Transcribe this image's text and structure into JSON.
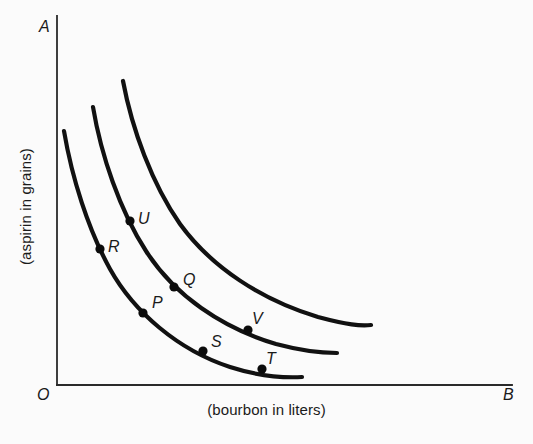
{
  "figure": {
    "background_color": "#fbfbfb",
    "ink_color": "#111111",
    "width": 533,
    "height": 444
  },
  "axes": {
    "y_axis_letter": "A",
    "x_axis_letter": "B",
    "origin_letter": "O",
    "x_title": "(bourbon in liters)",
    "y_title": "(aspirin in grains)",
    "x_axis_pixels": {
      "x1": 57,
      "y1": 385,
      "x2": 512,
      "y2": 385
    },
    "y_axis_pixels": {
      "x1": 57,
      "y1": 16,
      "x2": 57,
      "y2": 385
    }
  },
  "chart_data": {
    "type": "line",
    "title": "",
    "subtitle": "",
    "xlabel": "(bourbon in liters)",
    "ylabel": "(aspirin in grains)",
    "xlim": [
      0,
      100
    ],
    "ylim": [
      0,
      100
    ],
    "grid": false,
    "legend": "none",
    "axis_endpoint_labels": {
      "x": "B",
      "y": "A",
      "origin": "O"
    },
    "note": "Three convex, downward-sloping indifference curves (hyperbola-like). Values are read off the unlabeled axes as percentages of the plotted area; higher curves represent higher utility.",
    "series": [
      {
        "name": "I1",
        "description": "lowest indifference curve",
        "x": [
          2,
          6,
          11,
          17,
          24,
          32,
          41,
          50,
          58,
          63
        ],
        "y": [
          69,
          53,
          42,
          34,
          27,
          21,
          16,
          12,
          9,
          8
        ],
        "labeled_points": [
          {
            "label": "R",
            "x": 9.5,
            "y": 36.5,
            "pixel": {
              "x": 100,
              "y": 249
            }
          },
          {
            "label": "P",
            "x": 19,
            "y": 19.5,
            "pixel": {
              "x": 143,
              "y": 313
            }
          },
          {
            "label": "S",
            "x": 32,
            "y": 9.2,
            "pixel": {
              "x": 203,
              "y": 351
            }
          },
          {
            "label": "T",
            "x": 45,
            "y": 4.3,
            "pixel": {
              "x": 262,
              "y": 369
            }
          }
        ]
      },
      {
        "name": "I2",
        "description": "middle indifference curve",
        "x": [
          8,
          13,
          19,
          26,
          34,
          43,
          52,
          62,
          70,
          75
        ],
        "y": [
          75,
          60,
          48,
          39,
          32,
          26,
          21,
          17,
          14,
          13
        ],
        "labeled_points": [
          {
            "label": "Q",
            "x": 26,
            "y": 26.5,
            "pixel": {
              "x": 174,
              "y": 287
            }
          },
          {
            "label": "V",
            "x": 42,
            "y": 14.8,
            "pixel": {
              "x": 248,
              "y": 330
            }
          }
        ]
      },
      {
        "name": "I3",
        "description": "highest indifference curve",
        "x": [
          14,
          20,
          27,
          35,
          44,
          54,
          64,
          74,
          83,
          90
        ],
        "y": [
          82,
          68,
          56,
          47,
          40,
          34,
          29,
          25,
          22,
          20
        ],
        "labeled_points": [
          {
            "label": "U",
            "x": 16,
            "y": 44.5,
            "pixel": {
              "x": 130,
              "y": 221
            }
          }
        ]
      }
    ],
    "points": [
      {
        "label": "P",
        "curve": "I1"
      },
      {
        "label": "Q",
        "curve": "I2"
      },
      {
        "label": "R",
        "curve": "I1"
      },
      {
        "label": "S",
        "curve": "I1"
      },
      {
        "label": "T",
        "curve": "I1"
      },
      {
        "label": "U",
        "curve": "I3"
      },
      {
        "label": "V",
        "curve": "I2"
      }
    ]
  },
  "geometry": {
    "curves": [
      {
        "name": "I1",
        "path": "M 64 131 C 72 178, 88 229, 110 269 C 134 312, 178 350, 230 367 C 258 376, 282 378, 302 377"
      },
      {
        "name": "I2",
        "path": "M 93 107 C 101 155, 120 211, 146 251 C 174 295, 222 328, 276 344 C 306 352, 322 353, 337 353"
      },
      {
        "name": "I3",
        "path": "M 123 81 C 132 129, 152 184, 180 224 C 212 268, 262 300, 318 317 C 348 325, 360 326, 371 325"
      }
    ],
    "dots": [
      {
        "label": "R",
        "cx": 100,
        "cy": 249,
        "r": 4.6
      },
      {
        "label": "U",
        "cx": 130,
        "cy": 221,
        "r": 4.6
      },
      {
        "label": "P",
        "cx": 143,
        "cy": 313,
        "r": 4.6
      },
      {
        "label": "Q",
        "cx": 174,
        "cy": 287,
        "r": 4.6
      },
      {
        "label": "S",
        "cx": 203,
        "cy": 351,
        "r": 4.6
      },
      {
        "label": "V",
        "cx": 248,
        "cy": 330,
        "r": 4.6
      },
      {
        "label": "T",
        "cx": 262,
        "cy": 369,
        "r": 4.6
      }
    ],
    "labels": [
      {
        "label": "U",
        "left": 138,
        "top": 211
      },
      {
        "label": "R",
        "left": 108,
        "top": 239
      },
      {
        "label": "Q",
        "left": 183,
        "top": 272
      },
      {
        "label": "P",
        "left": 152,
        "top": 295
      },
      {
        "label": "V",
        "left": 252,
        "top": 311
      },
      {
        "label": "S",
        "left": 211,
        "top": 334
      },
      {
        "label": "T",
        "left": 266,
        "top": 351
      }
    ],
    "axis_letters": [
      {
        "key": "A",
        "left": 39,
        "top": 19
      },
      {
        "key": "B",
        "left": 503,
        "top": 387
      },
      {
        "key": "O",
        "left": 37,
        "top": 387
      }
    ]
  }
}
